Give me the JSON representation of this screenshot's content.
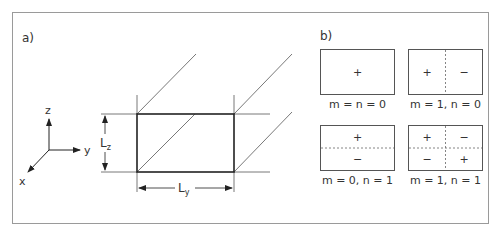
{
  "panel_a": {
    "label": "a)",
    "axes": {
      "z": "z",
      "y": "y",
      "x": "x"
    },
    "dim_z": {
      "base": "L",
      "sub": "z"
    },
    "dim_y": {
      "base": "L",
      "sub": "y"
    }
  },
  "panel_b": {
    "label": "b)",
    "modes": [
      {
        "caption": "m = n = 0",
        "signs": [
          "+"
        ]
      },
      {
        "caption": "m = 1, n = 0",
        "signs": [
          "+",
          "−"
        ]
      },
      {
        "caption": "m = 0, n = 1",
        "signs": [
          "+",
          "−"
        ]
      },
      {
        "caption": "m = 1, n = 1",
        "signs": [
          "+",
          "−",
          "−",
          "+"
        ]
      }
    ]
  },
  "colors": {
    "frame": "#9a9a9a",
    "line": "#333333",
    "thin": "#555555"
  }
}
